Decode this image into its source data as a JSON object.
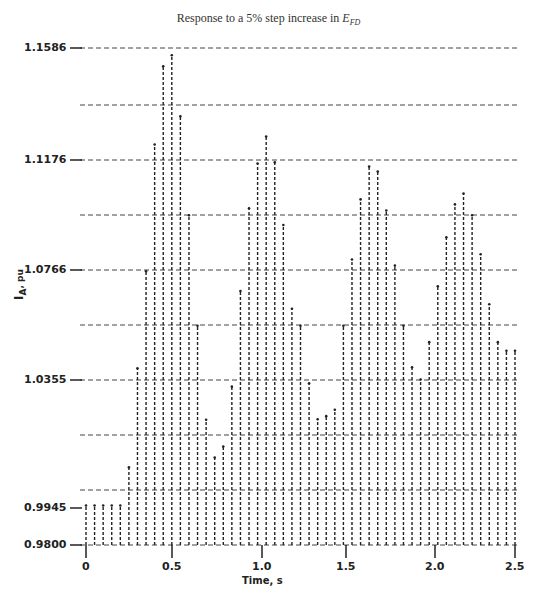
{
  "chart_data": {
    "type": "bar",
    "title_main": "Response to a 5% step increase in ",
    "title_symbol": "E",
    "title_subscript": "FD",
    "xlabel": "Time, s",
    "ylabel": "I_A, pu",
    "ylabel_main": "I",
    "ylabel_sub": "A",
    "ylabel_unit": ", pu",
    "x_ticks": [
      "0",
      "0.5",
      "1.0",
      "1.5",
      "2.0",
      "2.5"
    ],
    "y_ticks": [
      "1.1586",
      "1.1176",
      "1.0766",
      "1.0355",
      "0.9945",
      "0.9800"
    ],
    "xlim": [
      0,
      2.5
    ],
    "ylim": [
      0.98,
      1.1586
    ],
    "grid": true,
    "grid_style": "dashed",
    "x": [
      0,
      0.05,
      0.1,
      0.15,
      0.2,
      0.25,
      0.3,
      0.35,
      0.4,
      0.45,
      0.5,
      0.55,
      0.6,
      0.65,
      0.7,
      0.75,
      0.8,
      0.85,
      0.9,
      0.95,
      1.0,
      1.05,
      1.1,
      1.15,
      1.2,
      1.25,
      1.3,
      1.35,
      1.4,
      1.45,
      1.5,
      1.55,
      1.6,
      1.65,
      1.7,
      1.75,
      1.8,
      1.85,
      1.9,
      1.95,
      2.0,
      2.05,
      2.1,
      2.15,
      2.2,
      2.25,
      2.3,
      2.35,
      2.4,
      2.45,
      2.5
    ],
    "values": [
      0.9942,
      0.9942,
      0.9942,
      0.9942,
      0.9942,
      1.0079,
      1.0435,
      1.0784,
      1.1239,
      1.152,
      1.156,
      1.1341,
      1.0985,
      1.0588,
      1.025,
      1.0114,
      1.0154,
      1.0369,
      1.0713,
      1.101,
      1.1171,
      1.1268,
      1.1175,
      1.095,
      1.0649,
      1.0588,
      1.0381,
      1.0252,
      1.0263,
      1.0286,
      1.0588,
      1.0826,
      1.1042,
      1.116,
      1.1142,
      1.1002,
      1.0804,
      1.0588,
      1.0439,
      1.0395,
      1.0529,
      1.073,
      1.0906,
      1.1024,
      1.1063,
      1.0985,
      1.0845,
      1.0665,
      1.0529,
      1.0498,
      1.0498
    ]
  }
}
